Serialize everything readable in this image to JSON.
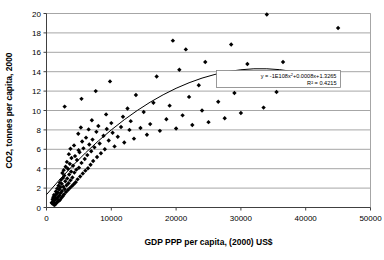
{
  "chart_data": {
    "type": "scatter",
    "title": "",
    "xlabel": "GDP PPP per capita, (2000) US$",
    "ylabel": "CO2, tonnes per capita, 2000",
    "xlim": [
      0,
      50000
    ],
    "ylim": [
      0,
      20
    ],
    "xticks": [
      "0",
      "10000",
      "20000",
      "30000",
      "40000",
      "50000"
    ],
    "xtick_values": [
      0,
      10000,
      20000,
      30000,
      40000,
      50000
    ],
    "yticks": [
      "0",
      "2",
      "4",
      "6",
      "8",
      "10",
      "12",
      "14",
      "16",
      "18",
      "20"
    ],
    "ytick_values": [
      0,
      2,
      4,
      6,
      8,
      10,
      12,
      14,
      16,
      18,
      20
    ],
    "grid": "horizontal",
    "legend": "none",
    "marker": "diamond",
    "marker_color": "#000000",
    "trendline": {
      "type": "polynomial-order-2",
      "equation_label": "y = -1E108x",
      "equation_full": "y = -1E108x² + 0.0008x + 1.3265",
      "r2_label": "R² = 0.4215",
      "r2_value": 0.4215,
      "coef_a_label": "-1E108",
      "coef_b": 0.0008,
      "coef_c": 1.3265,
      "color": "#000000",
      "points": [
        [
          0,
          1.33
        ],
        [
          2000,
          2.85
        ],
        [
          4000,
          4.28
        ],
        [
          6000,
          5.62
        ],
        [
          8000,
          6.86
        ],
        [
          10000,
          8.0
        ],
        [
          12000,
          9.05
        ],
        [
          14000,
          10.0
        ],
        [
          16000,
          10.86
        ],
        [
          18000,
          11.62
        ],
        [
          20000,
          12.29
        ],
        [
          22000,
          12.86
        ],
        [
          24000,
          13.34
        ],
        [
          26000,
          13.72
        ],
        [
          28000,
          14.01
        ],
        [
          30000,
          14.2
        ],
        [
          32000,
          14.3
        ],
        [
          34000,
          14.3
        ],
        [
          36000,
          14.21
        ],
        [
          38000,
          14.02
        ],
        [
          40000,
          13.74
        ],
        [
          42000,
          13.36
        ],
        [
          44000,
          12.89
        ]
      ]
    },
    "points": [
      [
        1200,
        0.25
      ],
      [
        1350,
        0.32
      ],
      [
        900,
        0.4
      ],
      [
        1500,
        0.45
      ],
      [
        800,
        0.5
      ],
      [
        1100,
        0.55
      ],
      [
        1700,
        0.6
      ],
      [
        1000,
        0.65
      ],
      [
        1900,
        0.7
      ],
      [
        1250,
        0.75
      ],
      [
        2100,
        0.8
      ],
      [
        950,
        0.85
      ],
      [
        1600,
        0.9
      ],
      [
        1400,
        0.95
      ],
      [
        2300,
        1.0
      ],
      [
        1050,
        1.05
      ],
      [
        1800,
        1.1
      ],
      [
        2500,
        1.15
      ],
      [
        1300,
        1.2
      ],
      [
        2000,
        1.25
      ],
      [
        1150,
        1.3
      ],
      [
        2700,
        1.35
      ],
      [
        1550,
        1.4
      ],
      [
        2200,
        1.5
      ],
      [
        1750,
        1.55
      ],
      [
        3000,
        1.6
      ],
      [
        1450,
        1.65
      ],
      [
        2400,
        1.7
      ],
      [
        3300,
        1.8
      ],
      [
        1950,
        1.85
      ],
      [
        2800,
        1.9
      ],
      [
        1650,
        1.95
      ],
      [
        3600,
        2.0
      ],
      [
        2150,
        2.1
      ],
      [
        2600,
        2.15
      ],
      [
        3900,
        2.2
      ],
      [
        1850,
        2.25
      ],
      [
        3100,
        2.3
      ],
      [
        4200,
        2.4
      ],
      [
        2350,
        2.45
      ],
      [
        3400,
        2.5
      ],
      [
        2050,
        2.55
      ],
      [
        4500,
        2.6
      ],
      [
        2900,
        2.7
      ],
      [
        3700,
        2.8
      ],
      [
        2250,
        2.85
      ],
      [
        4800,
        2.9
      ],
      [
        3200,
        3.0
      ],
      [
        2550,
        3.05
      ],
      [
        4000,
        3.1
      ],
      [
        5200,
        3.2
      ],
      [
        2750,
        3.3
      ],
      [
        3500,
        3.4
      ],
      [
        5600,
        3.5
      ],
      [
        2450,
        3.55
      ],
      [
        4300,
        3.6
      ],
      [
        3800,
        3.7
      ],
      [
        6000,
        3.8
      ],
      [
        2650,
        3.85
      ],
      [
        4600,
        3.9
      ],
      [
        3300,
        4.0
      ],
      [
        6400,
        4.05
      ],
      [
        5000,
        4.1
      ],
      [
        2950,
        4.2
      ],
      [
        4100,
        4.3
      ],
      [
        6800,
        4.4
      ],
      [
        3600,
        4.5
      ],
      [
        5400,
        4.6
      ],
      [
        3150,
        4.7
      ],
      [
        7200,
        4.8
      ],
      [
        4700,
        4.9
      ],
      [
        5900,
        5.0
      ],
      [
        3850,
        5.1
      ],
      [
        7800,
        5.2
      ],
      [
        4400,
        5.3
      ],
      [
        6300,
        5.4
      ],
      [
        3450,
        5.5
      ],
      [
        8400,
        5.6
      ],
      [
        5100,
        5.7
      ],
      [
        6900,
        5.8
      ],
      [
        4950,
        5.9
      ],
      [
        9000,
        6.0
      ],
      [
        3700,
        6.05
      ],
      [
        5700,
        6.1
      ],
      [
        7400,
        6.2
      ],
      [
        10500,
        6.3
      ],
      [
        4250,
        6.4
      ],
      [
        6600,
        6.5
      ],
      [
        8200,
        6.6
      ],
      [
        12000,
        6.7
      ],
      [
        5500,
        6.8
      ],
      [
        9600,
        6.9
      ],
      [
        7100,
        7.0
      ],
      [
        13500,
        7.1
      ],
      [
        6100,
        7.2
      ],
      [
        11000,
        7.3
      ],
      [
        8800,
        7.4
      ],
      [
        15500,
        7.5
      ],
      [
        4900,
        7.6
      ],
      [
        10200,
        7.7
      ],
      [
        7700,
        7.8
      ],
      [
        17500,
        7.9
      ],
      [
        12800,
        8.0
      ],
      [
        6500,
        8.05
      ],
      [
        9300,
        8.1
      ],
      [
        20000,
        8.15
      ],
      [
        14500,
        8.2
      ],
      [
        5300,
        8.25
      ],
      [
        11500,
        8.3
      ],
      [
        8000,
        8.4
      ],
      [
        22500,
        8.5
      ],
      [
        16000,
        8.6
      ],
      [
        10000,
        8.7
      ],
      [
        25000,
        8.8
      ],
      [
        13000,
        8.9
      ],
      [
        7000,
        9.0
      ],
      [
        18500,
        9.1
      ],
      [
        27500,
        9.2
      ],
      [
        11800,
        9.35
      ],
      [
        21000,
        9.5
      ],
      [
        9200,
        9.6
      ],
      [
        30000,
        9.75
      ],
      [
        15000,
        9.85
      ],
      [
        24000,
        10.0
      ],
      [
        12500,
        10.2
      ],
      [
        2800,
        10.4
      ],
      [
        19000,
        10.5
      ],
      [
        33500,
        10.3
      ],
      [
        16500,
        10.8
      ],
      [
        26500,
        10.9
      ],
      [
        5400,
        11.2
      ],
      [
        22000,
        11.4
      ],
      [
        13800,
        11.6
      ],
      [
        29000,
        11.8
      ],
      [
        7600,
        12.0
      ],
      [
        35500,
        11.9
      ],
      [
        9800,
        13.0
      ],
      [
        23500,
        12.6
      ],
      [
        17000,
        13.5
      ],
      [
        27000,
        13.2
      ],
      [
        20500,
        14.2
      ],
      [
        31000,
        14.8
      ],
      [
        24500,
        15.0
      ],
      [
        36500,
        15.0
      ],
      [
        21500,
        16.3
      ],
      [
        28500,
        16.8
      ],
      [
        19500,
        17.2
      ],
      [
        34000,
        19.9
      ],
      [
        45000,
        18.5
      ]
    ]
  }
}
